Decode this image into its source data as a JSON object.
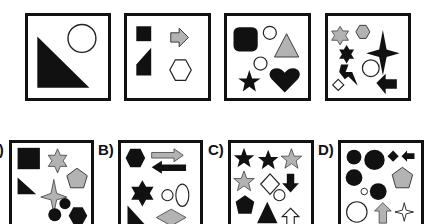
{
  "puzzle": {
    "question_row": [
      {
        "id": "q1",
        "shapes": [
          "black right triangle",
          "white circle"
        ]
      },
      {
        "id": "q2",
        "shapes": [
          "black square",
          "gray arrow right",
          "black trapezoid",
          "white hexagon"
        ]
      },
      {
        "id": "q3",
        "shapes": [
          "black rounded square",
          "white circle",
          "gray triangle",
          "white circle",
          "black star",
          "black heart"
        ]
      },
      {
        "id": "q4",
        "shapes": [
          "gray six-point star",
          "gray hexagon",
          "black six-point star",
          "black four-point star",
          "black lightning",
          "white circle",
          "white diamond",
          "black arrow left"
        ]
      }
    ],
    "options": [
      {
        "label": "A)",
        "shapes": [
          "black square",
          "gray six-point star",
          "gray pentagon",
          "black right triangle",
          "gray four-point star",
          "black circle",
          "black circle",
          "black hexagon"
        ]
      },
      {
        "label": "B)",
        "shapes": [
          "black hexagon",
          "gray arrow right",
          "black arrow left",
          "black six-point star",
          "white circle",
          "white ellipse",
          "black right triangle",
          "gray diamond"
        ]
      },
      {
        "label": "C)",
        "shapes": [
          "black star",
          "black star",
          "gray star",
          "gray star",
          "white diamond",
          "black arrow down",
          "white circle",
          "black pentagon",
          "black triangle",
          "white arrow up"
        ]
      },
      {
        "label": "D)",
        "shapes": [
          "black circle",
          "black circle",
          "black diamond",
          "black arrow left",
          "black circle",
          "gray pentagon",
          "white circle",
          "black circle",
          "white circle",
          "gray arrow up",
          "white four-point star"
        ]
      }
    ]
  },
  "colors": {
    "black": "#111111",
    "gray": "#b3b3b3",
    "white": "#ffffff"
  }
}
